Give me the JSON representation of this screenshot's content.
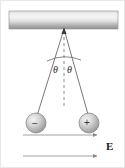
{
  "figure": {
    "width": 125,
    "height": 168,
    "background_color": "#ffffff",
    "border_color": "#e8e8e8"
  },
  "ceiling": {
    "name": "ceiling support bar",
    "x": 8,
    "y": 10,
    "width": 109,
    "height": 18,
    "color_top": "#d8d8d8",
    "color_mid": "#f2f2f2",
    "color_bottom": "#8f8f8f",
    "edge_color": "#9a9a9a"
  },
  "pivot": {
    "name": "common suspension point",
    "x": 63,
    "y": 28,
    "color": "#3a3a3a"
  },
  "strings": [
    {
      "name": "left string",
      "x1": 63,
      "y1": 28,
      "x2": 35,
      "y2": 118,
      "color": "#555555",
      "width": 0.8
    },
    {
      "name": "right string",
      "x1": 63,
      "y1": 28,
      "x2": 88,
      "y2": 117,
      "color": "#555555",
      "width": 0.8
    }
  ],
  "centerline": {
    "name": "vertical dashed reference line",
    "x1": 63,
    "y1": 30,
    "x2": 63,
    "y2": 108,
    "color": "#7a7a7a",
    "dash": "3,3",
    "width": 0.9
  },
  "angle_arc": {
    "name": "angle arc spanning both strings",
    "color": "#6a6a6a",
    "width": 0.8,
    "path": "M 46 60 Q 63 52 80 59"
  },
  "angle_labels": [
    {
      "symbol": "θ",
      "side": "left",
      "meaning": "angle of left string from vertical"
    },
    {
      "symbol": "θ",
      "side": "right",
      "meaning": "angle of right string from vertical"
    }
  ],
  "charges": [
    {
      "name": "negative charge bob",
      "sign": "−",
      "label": "negative",
      "cx": 35,
      "cy": 122,
      "r": 10,
      "fill_light": "#f0f0f0",
      "fill_dark": "#9e9e9e",
      "edge": "#7d7d7d"
    },
    {
      "name": "positive charge bob",
      "sign": "+",
      "label": "positive",
      "cx": 88,
      "cy": 122,
      "r": 10,
      "fill_light": "#f0f0f0",
      "fill_dark": "#9e9e9e",
      "edge": "#7d7d7d"
    }
  ],
  "field": {
    "label": "E",
    "label_meaning": "uniform electric field vector",
    "direction": "right",
    "color": "#8a8a8a",
    "lines": [
      {
        "x1": 22,
        "y1": 134,
        "x2": 98,
        "y2": 134
      },
      {
        "x1": 22,
        "y1": 155,
        "x2": 98,
        "y2": 155
      }
    ]
  }
}
